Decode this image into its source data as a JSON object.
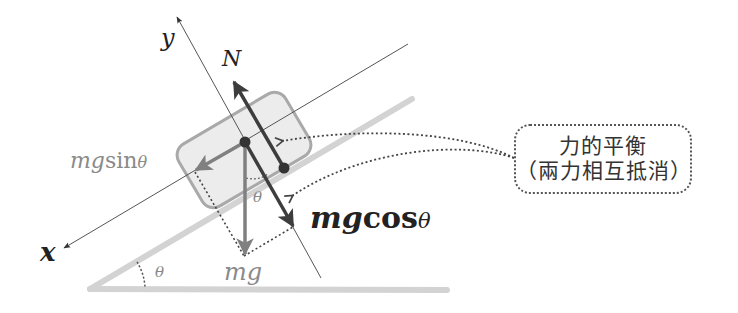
{
  "diagram": {
    "type": "free-body diagram — block on inclined plane",
    "axes": {
      "x_label": "x",
      "y_label": "y"
    },
    "forces": {
      "normal": "N",
      "gravity": "mg",
      "parallel_component": {
        "coef": "mg",
        "func": "sin",
        "angle": "θ"
      },
      "perpendicular_component": {
        "coef": "mg",
        "func": "cos",
        "angle": "θ"
      }
    },
    "angles": {
      "incline_angle": "θ",
      "inner_angle": "θ"
    },
    "callout": {
      "line1": "力的平衡",
      "line2": "（兩力相互抵消）"
    },
    "colors": {
      "incline": "#d6d6d6",
      "block_fill": "#ececec",
      "block_stroke": "#a9a9a9",
      "dark_arrow": "#3d3d3d",
      "gray_arrow": "#808080",
      "axis": "#555555",
      "dotted": "#444444"
    }
  }
}
